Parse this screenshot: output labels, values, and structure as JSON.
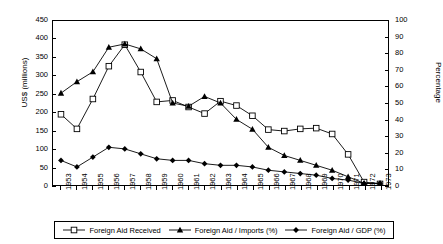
{
  "chart_data": {
    "type": "line",
    "title": "",
    "xlabel": "",
    "ylabel": "US$ (millions)",
    "y2label": "Percentage",
    "ylim": [
      0,
      450
    ],
    "y2lim": [
      0,
      100
    ],
    "grid": false,
    "legend_position": "bottom",
    "categories": [
      "1953",
      "1954",
      "1955",
      "1956",
      "1957",
      "1958",
      "1959",
      "1960",
      "1961",
      "1962",
      "1963",
      "1964",
      "1965",
      "1966",
      "1967",
      "1968",
      "1969",
      "1970",
      "1971",
      "1972",
      "1973"
    ],
    "y_ticks_left": [
      0,
      50,
      100,
      150,
      200,
      250,
      300,
      350,
      400,
      450
    ],
    "y_ticks_right": [
      0,
      10,
      20,
      30,
      40,
      50,
      60,
      70,
      80,
      90,
      100
    ],
    "series": [
      {
        "name": "Foreign Aid Received",
        "axis": "left",
        "marker": "open-square",
        "units": "US$ millions",
        "values": [
          194,
          154,
          236,
          326,
          385,
          310,
          228,
          232,
          214,
          196,
          230,
          218,
          190,
          152,
          148,
          154,
          156,
          140,
          84,
          8,
          3
        ]
      },
      {
        "name": "Foreign Aid / Imports (%)",
        "axis": "right",
        "marker": "filled-triangle",
        "units": "%",
        "values": [
          56,
          63,
          69,
          84,
          86,
          83,
          77,
          50,
          48,
          54,
          50,
          40,
          34,
          23,
          18,
          15,
          12,
          9,
          5,
          1,
          1
        ]
      },
      {
        "name": "Foreign Aid / GDP (%)",
        "axis": "right",
        "marker": "filled-diamond",
        "units": "%",
        "values": [
          15,
          11,
          17,
          23,
          22,
          19,
          16,
          15,
          15,
          13,
          12,
          12,
          11,
          9,
          8,
          7,
          6,
          4,
          3,
          1,
          1
        ]
      }
    ]
  },
  "legend": {
    "items": [
      {
        "label": "Foreign Aid Received",
        "marker": "open-square"
      },
      {
        "label": "Foreign Aid / Imports (%)",
        "marker": "filled-triangle"
      },
      {
        "label": "Foreign Aid / GDP (%)",
        "marker": "filled-diamond"
      }
    ]
  },
  "colors": {
    "axis": "#000000",
    "series_line": "#000000",
    "background": "#ffffff"
  }
}
